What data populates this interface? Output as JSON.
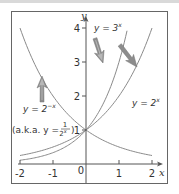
{
  "chart_data": {
    "type": "line",
    "title": "",
    "xlabel": "x",
    "ylabel": "y",
    "xlim": [
      -2.1,
      2.2
    ],
    "ylim": [
      0,
      4.3
    ],
    "grid": false,
    "x_ticks": [
      -2,
      -1,
      0,
      1,
      2
    ],
    "y_ticks": [
      1,
      2,
      3,
      4
    ],
    "x_tick_labels": [
      "-2",
      "-1",
      "0",
      "1",
      "2"
    ],
    "y_tick_labels": [
      "1",
      "2",
      "3",
      "4"
    ],
    "series": [
      {
        "name": "y = 2^-x",
        "x": [
          -2,
          -1.5,
          -1,
          -0.5,
          0,
          0.5,
          1,
          1.5,
          2
        ],
        "values": [
          4,
          2.83,
          2,
          1.41,
          1,
          0.71,
          0.5,
          0.35,
          0.25
        ]
      },
      {
        "name": "y = 2^x",
        "x": [
          -2,
          -1.5,
          -1,
          -0.5,
          0,
          0.5,
          1,
          1.5,
          2
        ],
        "values": [
          0.25,
          0.35,
          0.5,
          0.71,
          1,
          1.41,
          2,
          2.83,
          4
        ]
      },
      {
        "name": "y = 3^x",
        "x": [
          -2,
          -1.5,
          -1,
          -0.5,
          0,
          0.5,
          1,
          1.26
        ],
        "values": [
          0.11,
          0.19,
          0.33,
          0.58,
          1,
          1.73,
          3,
          4
        ]
      }
    ],
    "annotations": [
      {
        "text": "y = 3^x",
        "arrow": true
      },
      {
        "text": "y = 2^x",
        "arrow": true
      },
      {
        "text": "y = 2^-x",
        "arrow": true
      },
      {
        "text": "(a.k.a. y = 1/2^x)",
        "arrow": false
      }
    ],
    "legend": "none"
  },
  "labels": {
    "x_axis": "x",
    "y_axis": "y",
    "origin": "0",
    "y3x_prefix": "y = 3",
    "y3x_exp": "x",
    "y2x_prefix": "y = 2",
    "y2x_exp": "x",
    "y2negx_prefix": "y = 2",
    "y2negx_exp": "−x",
    "aka_prefix": "(a.k.a. y = ",
    "aka_num": "1",
    "aka_den": "2",
    "aka_den_exp": "x",
    "aka_suffix": ")"
  },
  "colors": {
    "curve": "#8a8a8a",
    "axis": "#555555",
    "frame": "#666666",
    "arrow_fill": "#8c8c8c",
    "arrow_highlight": "#c9c9c9"
  }
}
